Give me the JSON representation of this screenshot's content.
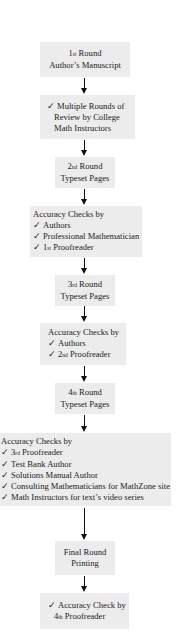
{
  "flowchart": {
    "colors": {
      "box_fill": "#ececec",
      "arrow": "#111111",
      "text": "#222222",
      "background": "#ffffff"
    },
    "check_glyph": "✓",
    "steps": [
      {
        "id": "step-1",
        "lines": [
          {
            "num": "1",
            "ord": "st",
            "text": "Round"
          },
          {
            "text": "Author’s Manuscript"
          }
        ]
      },
      {
        "id": "step-2",
        "lines": [
          {
            "check": true,
            "text": "Multiple Rounds of"
          },
          {
            "text": "Review by College"
          },
          {
            "text": "Math Instructors"
          }
        ]
      },
      {
        "id": "step-3",
        "lines": [
          {
            "num": "2",
            "ord": "nd",
            "text": "Round"
          },
          {
            "text": "Typeset Pages"
          }
        ]
      },
      {
        "id": "step-4",
        "lines": [
          {
            "text": "Accuracy Checks by"
          },
          {
            "check": true,
            "text": "Authors"
          },
          {
            "check": true,
            "text": "Professional Mathematician"
          },
          {
            "check": true,
            "num": "1",
            "ord": "st",
            "text": "Proofreader"
          }
        ]
      },
      {
        "id": "step-5",
        "lines": [
          {
            "num": "3",
            "ord": "rd",
            "text": "Round"
          },
          {
            "text": "Typeset Pages"
          }
        ]
      },
      {
        "id": "step-6",
        "lines": [
          {
            "text": "Accuracy Checks by"
          },
          {
            "check": true,
            "text": "Authors"
          },
          {
            "check": true,
            "num": "2",
            "ord": "nd",
            "text": "Proofreader"
          }
        ]
      },
      {
        "id": "step-7",
        "lines": [
          {
            "num": "4",
            "ord": "th",
            "text": "Round"
          },
          {
            "text": "Typeset Pages"
          }
        ]
      },
      {
        "id": "step-8",
        "lines": [
          {
            "text": "Accuracy Checks by"
          },
          {
            "check": true,
            "num": "3",
            "ord": "rd",
            "text": "Proofreader"
          },
          {
            "check": true,
            "text": "Test Bank Author"
          },
          {
            "check": true,
            "text": "Solutions Manual Author"
          },
          {
            "check": true,
            "text": "Consulting Mathematicians for MathZone site"
          },
          {
            "check": true,
            "text": "Math Instructors for text’s video series"
          }
        ]
      },
      {
        "id": "step-9",
        "lines": [
          {
            "text": "Final Round"
          },
          {
            "text": "Printing"
          }
        ]
      },
      {
        "id": "step-10",
        "lines": [
          {
            "check": true,
            "text": "Accuracy Check by"
          },
          {
            "num": "4",
            "ord": "th",
            "text": "Proofreader"
          }
        ]
      }
    ]
  }
}
